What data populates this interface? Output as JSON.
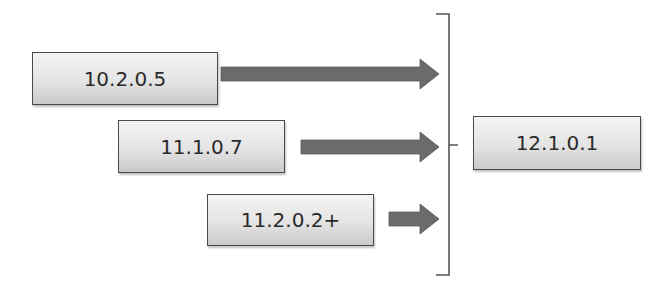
{
  "diagram": {
    "type": "upgrade-path",
    "sources": [
      {
        "label": "10.2.0.5"
      },
      {
        "label": "11.1.0.7"
      },
      {
        "label": "11.2.0.2+"
      }
    ],
    "target": {
      "label": "12.1.0.1"
    },
    "colors": {
      "arrow": "#6b6b6b",
      "box_border": "#4a4a4a",
      "box_fill_top": "#f4f4f4",
      "box_fill_bottom": "#c9c9c9",
      "bracket": "#555555",
      "text": "#2a2a2a"
    }
  }
}
